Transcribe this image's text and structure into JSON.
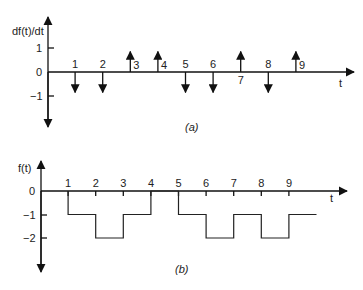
{
  "chart_data": [
    {
      "type": "impulse",
      "caption": "(a)",
      "ylabel": "df(t)/dt",
      "xlabel": "t",
      "y_ticks": [
        "1",
        "0",
        "−1"
      ],
      "y_tick_values": [
        1,
        0,
        -1
      ],
      "ylim": [
        -2,
        2
      ],
      "x_tick_labels": [
        "1",
        "2",
        "3",
        "4",
        "5",
        "6",
        "7",
        "8",
        "9"
      ],
      "impulses": [
        {
          "t": 1,
          "direction": -1
        },
        {
          "t": 2,
          "direction": -1
        },
        {
          "t": 3,
          "direction": 1
        },
        {
          "t": 4,
          "direction": 1
        },
        {
          "t": 5,
          "direction": -1
        },
        {
          "t": 6,
          "direction": -1
        },
        {
          "t": 7,
          "direction": 1
        },
        {
          "t": 8,
          "direction": -1
        },
        {
          "t": 9,
          "direction": 1
        }
      ]
    },
    {
      "type": "line",
      "caption": "(b)",
      "ylabel": "f(t)",
      "xlabel": "t",
      "y_ticks": [
        "0",
        "−1",
        "−2"
      ],
      "y_tick_values": [
        0,
        -1,
        -2
      ],
      "ylim": [
        -3.3,
        0.9
      ],
      "x_tick_labels": [
        "1",
        "2",
        "3",
        "4",
        "5",
        "6",
        "7",
        "8",
        "9"
      ],
      "segments": [
        {
          "from": 1,
          "to": 2,
          "value": -1
        },
        {
          "from": 2,
          "to": 3,
          "value": -2
        },
        {
          "from": 3,
          "to": 4,
          "value": -1
        },
        {
          "from": 5,
          "to": 6,
          "value": -1
        },
        {
          "from": 6,
          "to": 7,
          "value": -2
        },
        {
          "from": 7,
          "to": 8,
          "value": -1
        },
        {
          "from": 8,
          "to": 9,
          "value": -2
        },
        {
          "from": 9,
          "to": 10,
          "value": -1
        }
      ],
      "step_points": [
        [
          1,
          0
        ],
        [
          1,
          -1
        ],
        [
          2,
          -1
        ],
        [
          2,
          -2
        ],
        [
          3,
          -2
        ],
        [
          3,
          -1
        ],
        [
          4,
          -1
        ],
        [
          4,
          0
        ],
        [
          5,
          0
        ],
        [
          5,
          -1
        ],
        [
          6,
          -1
        ],
        [
          6,
          -2
        ],
        [
          7,
          -2
        ],
        [
          7,
          -1
        ],
        [
          8,
          -1
        ],
        [
          8,
          -2
        ],
        [
          9,
          -2
        ],
        [
          9,
          -1
        ],
        [
          10,
          -1
        ]
      ]
    }
  ]
}
